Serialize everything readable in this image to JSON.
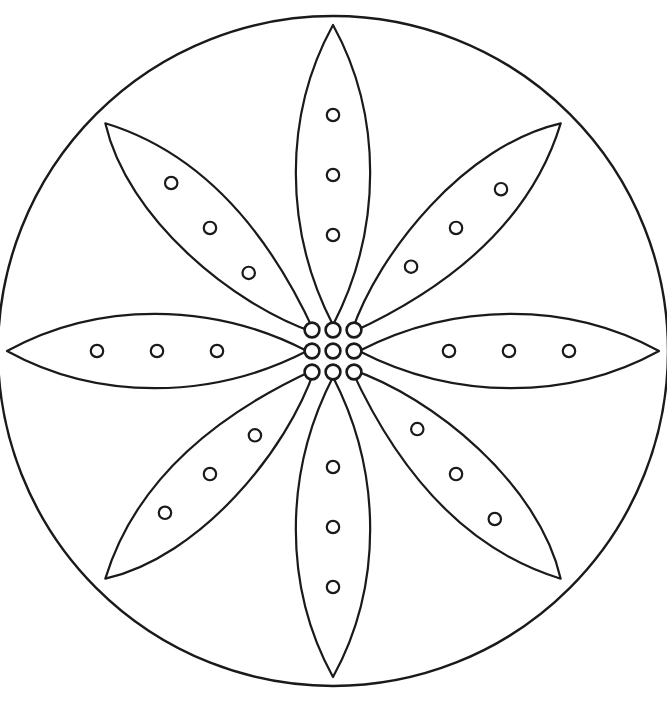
{
  "artwork": {
    "title": "Flower Mandala Coloring Page",
    "kind": "line-art-coloring-page",
    "background_color": "#ffffff",
    "line_color": "#1a1a1a",
    "line_width": 2.2
  },
  "canvas": {
    "width": 667,
    "height": 703
  },
  "outer_circle": {
    "name": "outer-boundary-circle",
    "cx": 333,
    "cy": 351,
    "r": 335,
    "stroke_width": 2.4
  },
  "petals": {
    "count": 8,
    "angle_step_deg": 45,
    "dots_per_petal": 3,
    "dot_radius": 6.2,
    "items": [
      {
        "id": "petal-n",
        "label": "North Petal",
        "angle_deg": -90,
        "style": "cardinal",
        "tip_x": 333,
        "tip_y": 44,
        "length": 300,
        "half_width": 42,
        "dot_offsets": [
          0.3,
          0.5,
          0.7
        ]
      },
      {
        "id": "petal-ne",
        "label": "North-East Petal",
        "angle_deg": -45,
        "style": "diagonal",
        "tip_x": 545,
        "tip_y": 131,
        "length": 296,
        "half_width": 40,
        "dot_offsets": [
          0.3,
          0.5,
          0.7
        ]
      },
      {
        "id": "petal-e",
        "label": "East Petal",
        "angle_deg": 0,
        "style": "cardinal",
        "tip_x": 633,
        "tip_y": 351,
        "length": 300,
        "half_width": 42,
        "dot_offsets": [
          0.3,
          0.5,
          0.7
        ]
      },
      {
        "id": "petal-se",
        "label": "South-East Petal",
        "angle_deg": 45,
        "style": "diagonal",
        "tip_x": 548,
        "tip_y": 569,
        "length": 296,
        "half_width": 40,
        "dot_offsets": [
          0.3,
          0.5,
          0.7
        ]
      },
      {
        "id": "petal-s",
        "label": "South Petal",
        "angle_deg": 90,
        "style": "cardinal",
        "tip_x": 333,
        "tip_y": 658,
        "length": 300,
        "half_width": 42,
        "dot_offsets": [
          0.3,
          0.5,
          0.7
        ]
      },
      {
        "id": "petal-sw",
        "label": "South-West Petal",
        "angle_deg": 135,
        "style": "diagonal",
        "tip_x": 131,
        "tip_y": 571,
        "length": 296,
        "half_width": 40,
        "dot_offsets": [
          0.3,
          0.5,
          0.7
        ]
      },
      {
        "id": "petal-w",
        "label": "West Petal",
        "angle_deg": 180,
        "style": "cardinal",
        "tip_x": 36,
        "tip_y": 351,
        "length": 300,
        "half_width": 42,
        "dot_offsets": [
          0.3,
          0.5,
          0.7
        ]
      },
      {
        "id": "petal-nw",
        "label": "North-West Petal",
        "angle_deg": -135,
        "style": "diagonal",
        "tip_x": 126,
        "tip_y": 134,
        "length": 296,
        "half_width": 40,
        "dot_offsets": [
          0.3,
          0.5,
          0.7
        ]
      }
    ]
  },
  "center_rosette": {
    "name": "center-dot-cluster",
    "cx": 333,
    "cy": 351,
    "dot_count": 9,
    "dot_radius": 7.4,
    "grid_spacing": 21,
    "grid": [
      [
        -1,
        -1
      ],
      [
        0,
        -1
      ],
      [
        1,
        -1
      ],
      [
        -1,
        0
      ],
      [
        0,
        0
      ],
      [
        1,
        0
      ],
      [
        -1,
        1
      ],
      [
        0,
        1
      ],
      [
        1,
        1
      ]
    ]
  }
}
